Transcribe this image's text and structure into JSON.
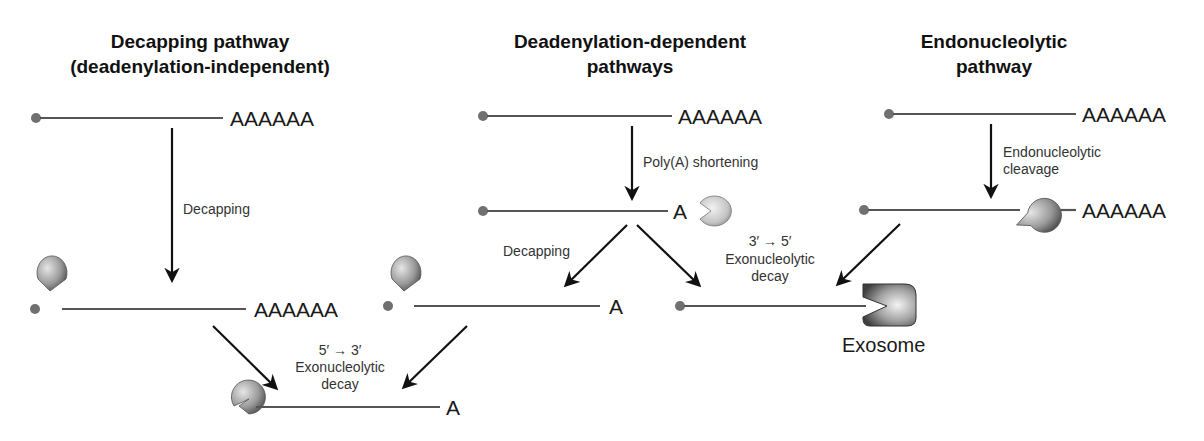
{
  "colors": {
    "rna_line": "#555555",
    "cap": "#707070",
    "enzyme_dark": "#5a5a5a",
    "enzyme_light": "#d8d8d8",
    "arrow": "#111111",
    "text": "#111111"
  },
  "columns": {
    "decapping": {
      "title_line1": "Decapping pathway",
      "title_line2": "(deadenylation-independent)",
      "mrna_tail": "AAAAAA",
      "step1_label": "Decapping",
      "decapped_tail": "AAAAAA"
    },
    "deadenylation": {
      "title_line1": "Deadenylation-dependent",
      "title_line2": "pathways",
      "mrna_tail": "AAAAAA",
      "step1_label": "Poly(A) shortening",
      "shortened_tail": "A",
      "branch_left_label": "Decapping",
      "decapped_tail": "A",
      "branch_right_label_line1": "3′ → 5′",
      "branch_right_label_line2": "Exonucleolytic",
      "branch_right_label_line3": "decay"
    },
    "endonucleolytic": {
      "title_line1": "Endonucleolytic",
      "title_line2": "pathway",
      "mrna_tail": "AAAAAA",
      "step1_label_line1": "Endonucleolytic",
      "step1_label_line2": "cleavage",
      "cleaved_tail": "AAAAAA"
    }
  },
  "convergence": {
    "five_to_three": {
      "label_line1": "5′ → 3′",
      "label_line2": "Exonucleolytic",
      "label_line3": "decay",
      "product_tail": "A"
    },
    "exosome": {
      "label": "Exosome"
    }
  }
}
